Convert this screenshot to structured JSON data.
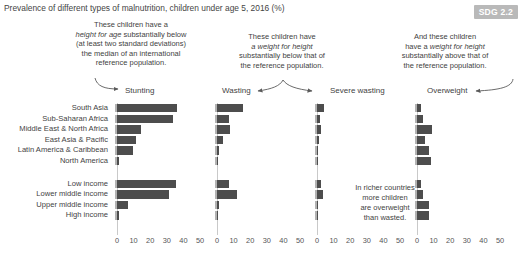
{
  "title": "Prevalence of different types of malnutrition, children under age 5, 2016 (%)",
  "badge": "SDG 2.2",
  "annotations": {
    "stunting": {
      "line1": "These children have a",
      "line2": "height for age",
      "line2b": " substantially below",
      "line3": "(at least two standard deviations)",
      "line4": "the median of an international",
      "line5": "reference population."
    },
    "wasting": {
      "line1": "These children have",
      "line2": "a weight for height",
      "line3": "substantially below that of",
      "line4": "the reference population."
    },
    "overweight": {
      "line1": "And these children",
      "line2a": "have a ",
      "line2": "weight for height",
      "line3": "substantially above that of",
      "line4": "the reference population."
    },
    "inline_note": {
      "line1": "In richer countries",
      "line2": "more children",
      "line3": "are overweight",
      "line4": "than wasted."
    }
  },
  "panels": [
    {
      "label": "Stunting"
    },
    {
      "label": "Wasting"
    },
    {
      "label": "Severe wasting"
    },
    {
      "label": "Overweight"
    }
  ],
  "rows": [
    "South Asia",
    "Sub-Saharan Africa",
    "Middle East & North Africa",
    "East Asia & Pacific",
    "Latin America & Caribbean",
    "North America",
    "Low income",
    "Lower middle income",
    "Upper middle income",
    "High income"
  ],
  "axis": {
    "ticks": [
      "0",
      "10",
      "20",
      "30",
      "40",
      "50"
    ],
    "min": 0,
    "max": 50
  },
  "colors": {
    "bar": "#4d4d4d",
    "badge_bg": "#b9b9b9",
    "text": "#3f3f3f",
    "axis": "#c9c9c9"
  },
  "chart_data": {
    "type": "bar",
    "title": "Prevalence of different types of malnutrition, children under age 5, 2016 (%)",
    "xlabel": "",
    "ylabel": "",
    "xlim": [
      0,
      50
    ],
    "grid": false,
    "legend": "none",
    "orientation": "horizontal",
    "panels": [
      "Stunting",
      "Wasting",
      "Severe wasting",
      "Overweight"
    ],
    "categories": [
      "South Asia",
      "Sub-Saharan Africa",
      "Middle East & North Africa",
      "East Asia & Pacific",
      "Latin America & Caribbean",
      "North America",
      "Low income",
      "Lower middle income",
      "Upper middle income",
      "High income"
    ],
    "series": [
      {
        "name": "Stunting",
        "values": [
          36.0,
          34.0,
          14.5,
          11.5,
          9.5,
          1.5,
          35.5,
          31.5,
          6.5,
          1.5
        ]
      },
      {
        "name": "Wasting",
        "values": [
          15.5,
          7.5,
          8.0,
          3.5,
          1.3,
          0.5,
          7.0,
          12.0,
          1.5,
          0.6
        ]
      },
      {
        "name": "Severe wasting",
        "values": [
          4.5,
          1.8,
          2.6,
          1.2,
          0.4,
          0.2,
          2.2,
          3.6,
          0.5,
          0.2
        ]
      },
      {
        "name": "Overweight",
        "values": [
          2.5,
          3.5,
          9.0,
          5.0,
          7.0,
          8.5,
          2.6,
          3.5,
          7.0,
          7.5
        ]
      }
    ]
  }
}
